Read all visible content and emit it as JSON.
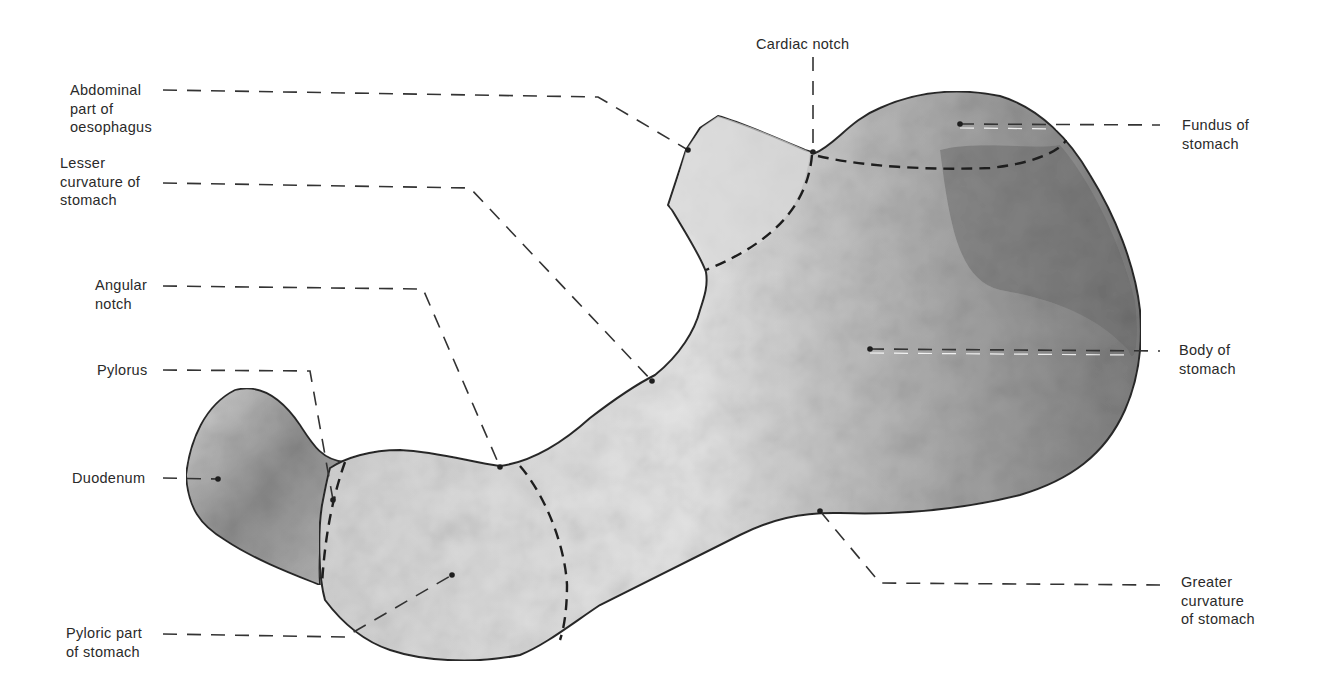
{
  "figure": {
    "colors": {
      "background": "#ffffff",
      "outline": "#2a2a2a",
      "tissue_light": "#e8e8e8",
      "tissue_mid": "#b4b4b4",
      "tissue_dark": "#7a7a7a",
      "leader_line": "#333333"
    }
  },
  "labels": {
    "abdominal_oesophagus": "Abdominal\npart of\noesophagus",
    "lesser_curvature": "Lesser\ncurvature of\nstomach",
    "angular_notch": "Angular\nnotch",
    "pylorus": "Pylorus",
    "duodenum": "Duodenum",
    "pyloric_part": "Pyloric part\nof stomach",
    "cardiac_notch": "Cardiac notch",
    "fundus": "Fundus of\nstomach",
    "body": "Body of\nstomach",
    "greater_curvature": "Greater\ncurvature\nof stomach"
  }
}
